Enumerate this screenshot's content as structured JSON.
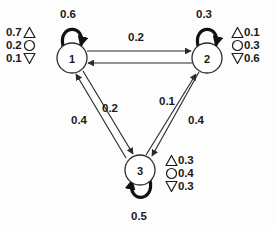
{
  "diagram": {
    "nodes": [
      {
        "id": "1",
        "label": "1",
        "cx": 72,
        "cy": 58,
        "r": 15
      },
      {
        "id": "2",
        "label": "2",
        "cx": 207,
        "cy": 58,
        "r": 15
      },
      {
        "id": "3",
        "label": "3",
        "cx": 140,
        "cy": 170,
        "r": 15
      }
    ],
    "self_loops": [
      {
        "node": "1",
        "weight": "0.6",
        "label_x": 68,
        "label_y": 14
      },
      {
        "node": "2",
        "weight": "0.3",
        "label_x": 204,
        "label_y": 14
      },
      {
        "node": "3",
        "weight": "0.5",
        "label_x": 139,
        "label_y": 216
      }
    ],
    "edges": [
      {
        "from": "1",
        "to": "2",
        "weight": "0.2",
        "label_x": 136,
        "label_y": 37
      },
      {
        "from": "2",
        "to": "1",
        "weight": "0.2",
        "label_x": 136,
        "label_y": 37
      },
      {
        "from": "1",
        "to": "3",
        "weight": "0.2",
        "label_x": 110,
        "label_y": 108
      },
      {
        "from": "3",
        "to": "1",
        "weight": "0.4",
        "label_x": 79,
        "label_y": 120
      },
      {
        "from": "2",
        "to": "3",
        "weight": "0.4",
        "label_x": 196,
        "label_y": 120
      },
      {
        "from": "3",
        "to": "2",
        "weight": "0.1",
        "label_x": 167,
        "label_y": 101
      }
    ],
    "legends": [
      {
        "id": "legend-node1",
        "node": "1",
        "order": "value-first",
        "rows": [
          {
            "symbol": "triangle-up",
            "value": "0.7"
          },
          {
            "symbol": "circle",
            "value": "0.2"
          },
          {
            "symbol": "triangle-down",
            "value": "0.1"
          }
        ]
      },
      {
        "id": "legend-node2",
        "node": "2",
        "order": "symbol-first",
        "rows": [
          {
            "symbol": "triangle-up",
            "value": "0.1"
          },
          {
            "symbol": "circle",
            "value": "0.3"
          },
          {
            "symbol": "triangle-down",
            "value": "0.6"
          }
        ]
      },
      {
        "id": "legend-node3",
        "node": "3",
        "order": "symbol-first",
        "rows": [
          {
            "symbol": "triangle-up",
            "value": "0.3"
          },
          {
            "symbol": "circle",
            "value": "0.4"
          },
          {
            "symbol": "triangle-down",
            "value": "0.3"
          }
        ]
      }
    ],
    "colors": {
      "stroke": "#2b2b2b",
      "loop_stroke": "#111111",
      "node_fill": "#ffffff",
      "background": "#fdfdfd",
      "text": "#1a1a1a"
    }
  }
}
